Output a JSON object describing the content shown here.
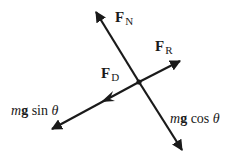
{
  "diagram": {
    "colors": {
      "line": "#1a1a1a",
      "background": "#ffffff"
    },
    "center": {
      "x": 139,
      "y": 82
    },
    "arrows": [
      {
        "id": "normal",
        "from": [
          139,
          82
        ],
        "to": [
          95,
          10
        ]
      },
      {
        "id": "weight-perp",
        "from": [
          139,
          82
        ],
        "to": [
          183,
          152
        ]
      },
      {
        "id": "resistance",
        "from": [
          139,
          82
        ],
        "to": [
          181,
          60
        ]
      },
      {
        "id": "weight-parallel",
        "from": [
          139,
          82
        ],
        "to": [
          50,
          130
        ]
      }
    ],
    "mid_arrowhead": {
      "id": "drag",
      "at": [
        107,
        99
      ],
      "direction": [
        -89,
        48
      ]
    },
    "labels": {
      "normal": {
        "symbol": "F",
        "subscript": "N"
      },
      "resistance": {
        "symbol": "F",
        "subscript": "R"
      },
      "drag": {
        "symbol": "F",
        "subscript": "D"
      },
      "weight_parallel": {
        "m": "m",
        "g": "g",
        "func": "sin",
        "angle": "θ"
      },
      "weight_perp": {
        "m": "m",
        "g": "g",
        "func": "cos",
        "angle": "θ"
      }
    }
  }
}
